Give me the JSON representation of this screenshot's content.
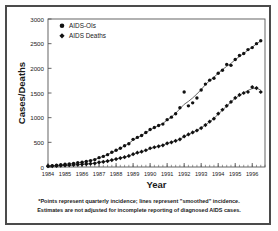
{
  "figure": {
    "frame_color": "#4a4a4a",
    "background": "#ffffff",
    "axis_color": "#555555",
    "marker_color": "#111111",
    "line_color": "#444444"
  },
  "footnote": {
    "line1": "*Points represent quarterly incidence; lines represent \"smoothed\" incidence.",
    "line2": "Estimates are not  adjusted for incomplete reporting of diagnosed AIDS cases."
  },
  "chart_data": {
    "type": "scatter",
    "title": "",
    "xlabel": "Year",
    "ylabel": "Cases/Deaths",
    "xlim": [
      1984.0,
      1996.75
    ],
    "ylim": [
      0,
      3000
    ],
    "yticks": [
      0,
      500,
      1000,
      1500,
      2000,
      2500,
      3000
    ],
    "xticks": [
      1984,
      1985,
      1986,
      1987,
      1988,
      1989,
      1990,
      1991,
      1992,
      1993,
      1994,
      1995,
      1996
    ],
    "xtick_labels": [
      "1984",
      "1985",
      "1986",
      "1987",
      "1988",
      "1989",
      "1990",
      "1991",
      "1992",
      "1993",
      "1994",
      "1995",
      "1996"
    ],
    "minor_xtick_interval": 0.25,
    "grid": false,
    "legend_position": "top-left",
    "legend": [
      "AIDS-OIs",
      "AIDS Deaths"
    ],
    "x": [
      1984.0,
      1984.25,
      1984.5,
      1984.75,
      1985.0,
      1985.25,
      1985.5,
      1985.75,
      1986.0,
      1986.25,
      1986.5,
      1986.75,
      1987.0,
      1987.25,
      1987.5,
      1987.75,
      1988.0,
      1988.25,
      1988.5,
      1988.75,
      1989.0,
      1989.25,
      1989.5,
      1989.75,
      1990.0,
      1990.25,
      1990.5,
      1990.75,
      1991.0,
      1991.25,
      1991.5,
      1991.75,
      1992.0,
      1992.25,
      1992.5,
      1992.75,
      1993.0,
      1993.25,
      1993.5,
      1993.75,
      1994.0,
      1994.25,
      1994.5,
      1994.75,
      1995.0,
      1995.25,
      1995.5,
      1995.75,
      1996.0,
      1996.25,
      1996.5
    ],
    "series": [
      {
        "name": "AIDS-OIs",
        "marker": "circle",
        "values": [
          20,
          28,
          35,
          45,
          55,
          62,
          70,
          85,
          95,
          110,
          130,
          150,
          190,
          215,
          250,
          300,
          340,
          380,
          430,
          470,
          560,
          600,
          640,
          700,
          760,
          800,
          840,
          870,
          960,
          1010,
          1080,
          1200,
          1520,
          1240,
          1300,
          1400,
          1560,
          1680,
          1760,
          1800,
          1900,
          1960,
          2080,
          2060,
          2180,
          2260,
          2300,
          2380,
          2420,
          2500,
          2560
        ]
      },
      {
        "name": "AIDS Deaths",
        "marker": "diamond",
        "values": [
          15,
          18,
          22,
          28,
          32,
          38,
          42,
          48,
          55,
          60,
          68,
          75,
          95,
          105,
          120,
          140,
          160,
          180,
          200,
          225,
          260,
          290,
          310,
          340,
          380,
          400,
          420,
          440,
          480,
          500,
          530,
          560,
          620,
          660,
          700,
          740,
          790,
          850,
          920,
          980,
          1080,
          1160,
          1240,
          1320,
          1400,
          1460,
          1500,
          1520,
          1620,
          1600,
          1520
        ]
      }
    ],
    "smoothed_series": [
      {
        "name": "AIDS-OIs smoothed",
        "values": [
          20,
          27,
          35,
          44,
          54,
          63,
          72,
          84,
          96,
          112,
          130,
          152,
          186,
          216,
          252,
          294,
          338,
          382,
          428,
          478,
          545,
          596,
          642,
          696,
          752,
          798,
          840,
          884,
          950,
          1014,
          1090,
          1180,
          1270,
          1330,
          1400,
          1480,
          1570,
          1670,
          1750,
          1820,
          1900,
          1975,
          2040,
          2100,
          2175,
          2240,
          2300,
          2370,
          2430,
          2495,
          2555
        ]
      },
      {
        "name": "AIDS Deaths smoothed",
        "values": [
          15,
          18,
          22,
          27,
          32,
          37,
          42,
          48,
          55,
          61,
          68,
          76,
          93,
          105,
          120,
          139,
          159,
          180,
          201,
          224,
          258,
          286,
          310,
          338,
          372,
          398,
          420,
          442,
          476,
          502,
          530,
          562,
          614,
          658,
          700,
          744,
          794,
          852,
          916,
          984,
          1070,
          1152,
          1236,
          1318,
          1392,
          1452,
          1502,
          1552,
          1590,
          1598,
          1560
        ]
      }
    ]
  }
}
